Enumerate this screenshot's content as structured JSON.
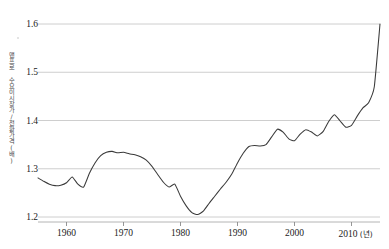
{
  "chart_data": {
    "type": "line",
    "title": "",
    "subtitle": "",
    "xlabel": "년",
    "xlabel_display": "(년)",
    "ylabel": "맨프로 수요이시장가/전환가격(배)",
    "xlim": [
      1955,
      2015
    ],
    "ylim": [
      1.2,
      1.6
    ],
    "grid": true,
    "grid_axis": "y",
    "legend": false,
    "legend_position": "none",
    "y_ticks": [
      "1.2",
      "1.3",
      "1.4",
      "1.5",
      "1.6"
    ],
    "y_tick_values": [
      1.2,
      1.3,
      1.4,
      1.5,
      1.6
    ],
    "x_ticks": [
      "1960",
      "1970",
      "1980",
      "1990",
      "2000",
      "2010"
    ],
    "x_tick_values": [
      1960,
      1970,
      1980,
      1990,
      2000,
      2010
    ],
    "line_color": "#3a3a3a",
    "grid_color": "#c8c8c8",
    "background_color": "#ffffff",
    "series": [
      {
        "name": "ratio",
        "x": [
          1955,
          1956,
          1957,
          1958,
          1959,
          1960,
          1961,
          1962,
          1963,
          1964,
          1965,
          1966,
          1967,
          1968,
          1969,
          1970,
          1971,
          1972,
          1973,
          1974,
          1975,
          1976,
          1977,
          1978,
          1979,
          1980,
          1981,
          1982,
          1983,
          1984,
          1985,
          1986,
          1987,
          1988,
          1989,
          1990,
          1991,
          1992,
          1993,
          1994,
          1995,
          1996,
          1997,
          1998,
          1999,
          2000,
          2001,
          2002,
          2003,
          2004,
          2005,
          2006,
          2007,
          2008,
          2009,
          2010,
          2011,
          2012,
          2013,
          2014,
          2015
        ],
        "values": [
          1.281,
          1.274,
          1.268,
          1.265,
          1.266,
          1.271,
          1.283,
          1.268,
          1.262,
          1.29,
          1.312,
          1.327,
          1.334,
          1.336,
          1.333,
          1.334,
          1.331,
          1.329,
          1.325,
          1.318,
          1.305,
          1.288,
          1.272,
          1.262,
          1.268,
          1.243,
          1.223,
          1.209,
          1.205,
          1.212,
          1.228,
          1.243,
          1.258,
          1.272,
          1.289,
          1.312,
          1.332,
          1.346,
          1.348,
          1.347,
          1.35,
          1.366,
          1.382,
          1.376,
          1.362,
          1.358,
          1.372,
          1.381,
          1.376,
          1.368,
          1.377,
          1.398,
          1.412,
          1.399,
          1.386,
          1.39,
          1.409,
          1.426,
          1.437,
          1.47,
          1.6
        ]
      }
    ]
  },
  "axis": {
    "y_title": "맨프로 수요이시장가/전환가격(배)",
    "x_unit_label": "(년)"
  }
}
